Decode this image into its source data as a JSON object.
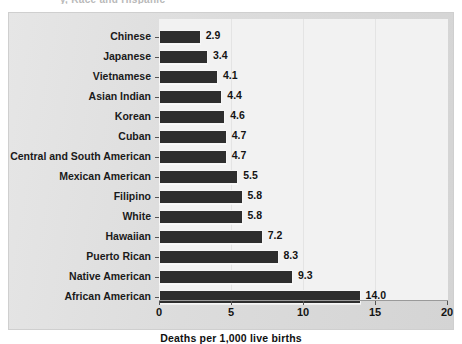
{
  "figure": {
    "title_remnant": "y, Race and Hispanic",
    "background_color": "#dddddd",
    "plot_background_color": "#f2f2f2",
    "bar_color": "#2e2e2e"
  },
  "chart_data": {
    "type": "bar",
    "orientation": "horizontal",
    "title": "",
    "xlabel": "Deaths per 1,000 live births",
    "ylabel": "",
    "xlim": [
      0,
      20
    ],
    "xticks": [
      "0",
      "5",
      "10",
      "15",
      "20"
    ],
    "grid": true,
    "grid_axis": "x",
    "legend": "none",
    "categories": [
      "Chinese",
      "Japanese",
      "Vietnamese",
      "Asian Indian",
      "Korean",
      "Cuban",
      "Central and South American",
      "Mexican American",
      "Filipino",
      "White",
      "Hawaiian",
      "Puerto Rican",
      "Native American",
      "African American"
    ],
    "values": [
      2.9,
      3.4,
      4.1,
      4.4,
      4.6,
      4.7,
      4.7,
      5.5,
      5.8,
      5.8,
      7.2,
      8.3,
      9.3,
      14.0
    ],
    "value_labels": [
      "2.9",
      "3.4",
      "4.1",
      "4.4",
      "4.6",
      "4.7",
      "4.7",
      "5.5",
      "5.8",
      "5.8",
      "7.2",
      "8.3",
      "9.3",
      "14.0"
    ]
  }
}
